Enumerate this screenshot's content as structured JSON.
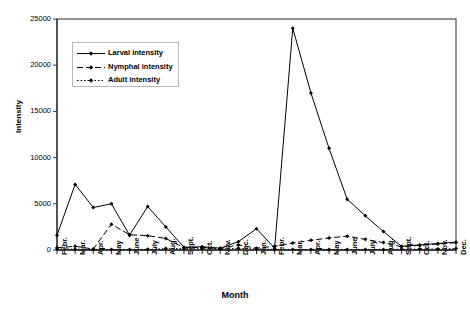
{
  "chart_data": {
    "type": "line",
    "title": "",
    "xlabel": "Month",
    "ylabel": "Intensity",
    "ylim": [
      0,
      25000
    ],
    "yticks": [
      0,
      5000,
      10000,
      15000,
      20000,
      25000
    ],
    "ytick_labels": [
      "0",
      "5000",
      "10000",
      "15000",
      "20000",
      "25000"
    ],
    "grid": false,
    "legend_position": "upper-left-inside",
    "categories": [
      "Febr.",
      "Mar.",
      "Apr.",
      "May",
      "June",
      "July",
      "Aug.",
      "Sept.",
      "Oct.",
      "Nov.",
      "Dec.",
      "Jan.",
      "Febr.",
      "Mar.",
      "Apr.",
      "May",
      "June",
      "July",
      "Aug.",
      "Sept.",
      "Oct.",
      "Nov.",
      "Dec."
    ],
    "series": [
      {
        "name": "Larval intensity",
        "line_style": "solid",
        "marker": "diamond",
        "color": "#000000",
        "values": [
          1600,
          7100,
          4600,
          5000,
          1600,
          4700,
          2500,
          300,
          350,
          200,
          900,
          2300,
          200,
          24000,
          17000,
          11000,
          5500,
          3700,
          2000,
          400,
          550,
          700,
          850
        ]
      },
      {
        "name": "Nymphal intensity",
        "line_style": "dashed",
        "marker": "diamond",
        "color": "#000000",
        "values": [
          250,
          400,
          100,
          2800,
          1650,
          1550,
          1250,
          250,
          300,
          150,
          550,
          200,
          400,
          750,
          1050,
          1300,
          1500,
          1150,
          800,
          350,
          500,
          650,
          800
        ]
      },
      {
        "name": "Adult  intensity",
        "line_style": "dotted",
        "marker": "diamond",
        "color": "#000000",
        "values": [
          120,
          90,
          60,
          60,
          60,
          70,
          150,
          150,
          200,
          100,
          180,
          120,
          60,
          60,
          60,
          60,
          60,
          60,
          60,
          80,
          100,
          120,
          150
        ]
      }
    ]
  },
  "axes": {
    "x_title": "Month",
    "y_title": "Intensity"
  },
  "legend": {
    "entries": [
      {
        "label": "Larval intensity",
        "style": "solid"
      },
      {
        "label": "Nymphal intensity",
        "style": "dashed"
      },
      {
        "label": "Adult  intensity",
        "style": "dotted"
      }
    ]
  }
}
